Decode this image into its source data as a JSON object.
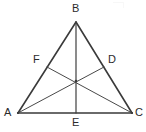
{
  "figure": {
    "type": "geometry-diagram",
    "background_color": "#ffffff",
    "stroke_color": "#3a3a3a",
    "label_color": "#2b2b2b",
    "canvas": {
      "width": 146,
      "height": 132
    }
  },
  "points": {
    "A": {
      "label": "A",
      "x": 18,
      "y": 113,
      "label_x": 4,
      "label_y": 107,
      "role": "vertex"
    },
    "B": {
      "label": "B",
      "x": 76,
      "y": 22,
      "label_x": 72,
      "label_y": 3,
      "role": "vertex"
    },
    "C": {
      "label": "C",
      "x": 132,
      "y": 113,
      "label_x": 135,
      "label_y": 107,
      "role": "vertex"
    },
    "D": {
      "label": "D",
      "x": 104,
      "y": 67,
      "label_x": 108,
      "label_y": 54,
      "role": "midpoint-of-BC"
    },
    "E": {
      "label": "E",
      "x": 76,
      "y": 113,
      "label_x": 72,
      "label_y": 117,
      "role": "midpoint-of-AC"
    },
    "F": {
      "label": "F",
      "x": 47,
      "y": 67,
      "label_x": 33,
      "label_y": 54,
      "role": "midpoint-of-AB"
    },
    "G": {
      "label": "",
      "x": 76,
      "y": 81,
      "role": "centroid"
    }
  },
  "segments": [
    {
      "name": "side-AB",
      "from": "A",
      "to": "B",
      "width": 1.6,
      "kind": "triangle-side"
    },
    {
      "name": "side-BC",
      "from": "B",
      "to": "C",
      "width": 1.6,
      "kind": "triangle-side"
    },
    {
      "name": "side-AC",
      "from": "A",
      "to": "C",
      "width": 1.6,
      "kind": "triangle-side"
    },
    {
      "name": "median-BE",
      "from": "B",
      "to": "E",
      "width": 1.2,
      "kind": "median"
    },
    {
      "name": "median-AD",
      "from": "A",
      "to": "D",
      "width": 1.0,
      "kind": "median"
    },
    {
      "name": "median-CF",
      "from": "C",
      "to": "F",
      "width": 1.0,
      "kind": "median"
    }
  ]
}
